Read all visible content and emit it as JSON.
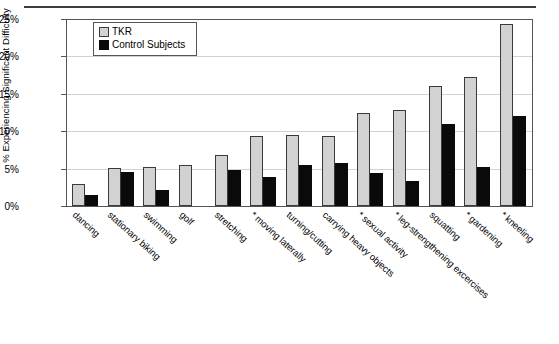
{
  "chart_data": {
    "type": "bar",
    "title": "",
    "xlabel": "",
    "ylabel": "% Experiencing Significant Difficulty",
    "ylim": [
      0,
      25
    ],
    "yticks": [
      "0%",
      "5%",
      "10%",
      "15%",
      "20%",
      "25%"
    ],
    "ytick_values": [
      0,
      5,
      10,
      15,
      20,
      25
    ],
    "grid": "horizontal",
    "legend_position": "top-left inside plot",
    "categories": [
      "dancing",
      "stationary biking",
      "swimming",
      "golf",
      "stretching",
      "* moving laterally",
      "turning/cutting",
      "carrying heavy objects",
      "* sexual activity",
      "* leg-strengthening excercises",
      "squatting",
      "* gardening",
      "* kneeling"
    ],
    "series": [
      {
        "name": "TKR",
        "color": "#d2d2d2",
        "values": [
          2.9,
          5.1,
          5.3,
          5.5,
          6.9,
          9.4,
          9.5,
          9.4,
          12.5,
          12.9,
          16.1,
          17.3,
          24.5
        ]
      },
      {
        "name": "Control Subjects",
        "color": "#0a0a0a",
        "values": [
          1.5,
          4.6,
          2.1,
          null,
          4.9,
          3.9,
          5.5,
          5.8,
          4.5,
          3.4,
          11.0,
          5.2,
          12.1
        ]
      }
    ]
  },
  "legend": {
    "items": [
      {
        "label": "TKR",
        "swatch": "light-gray-square"
      },
      {
        "label": "Control Subjects",
        "swatch": "black-square"
      }
    ]
  }
}
